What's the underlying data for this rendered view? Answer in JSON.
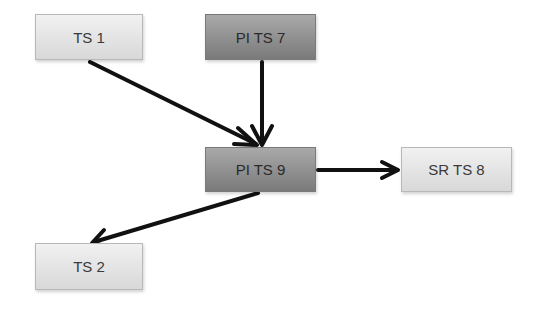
{
  "diagram": {
    "nodes": [
      {
        "id": "ts1",
        "label": "TS 1",
        "style": "light",
        "x": 35,
        "y": 14,
        "w": 108,
        "h": 46
      },
      {
        "id": "pits7",
        "label": "PI TS 7",
        "style": "dark",
        "x": 205,
        "y": 14,
        "w": 111,
        "h": 46
      },
      {
        "id": "pits9",
        "label": "PI TS 9",
        "style": "dark",
        "x": 205,
        "y": 147,
        "w": 111,
        "h": 45
      },
      {
        "id": "srts8",
        "label": "SR TS 8",
        "style": "light",
        "x": 401,
        "y": 147,
        "w": 111,
        "h": 45
      },
      {
        "id": "ts2",
        "label": "TS 2",
        "style": "light",
        "x": 35,
        "y": 243,
        "w": 108,
        "h": 47
      }
    ],
    "edges": [
      {
        "from": "ts1",
        "to": "pits9"
      },
      {
        "from": "pits7",
        "to": "pits9"
      },
      {
        "from": "pits9",
        "to": "srts8"
      },
      {
        "from": "pits9",
        "to": "ts2"
      }
    ],
    "colors": {
      "edge": "#111111",
      "light_fill": "#e4e4e4",
      "dark_fill": "#8f8f8f"
    }
  }
}
